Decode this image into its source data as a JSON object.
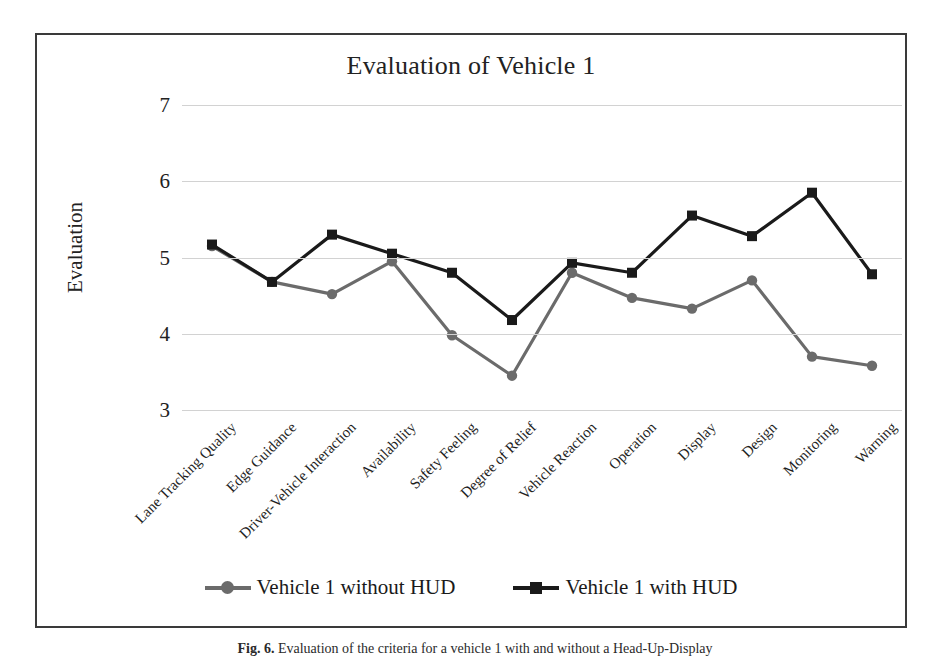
{
  "figure": {
    "caption_label": "Fig. 6.",
    "caption_text": "Evaluation of the criteria for a vehicle 1 with and without a Head-Up-Display"
  },
  "chart_data": {
    "type": "line",
    "title": "Evaluation of Vehicle 1",
    "xlabel": "",
    "ylabel": "Evaluation",
    "ylim": [
      3,
      7
    ],
    "yticks": [
      3,
      4,
      5,
      6,
      7
    ],
    "grid": true,
    "legend_position": "bottom",
    "categories": [
      "Lane Tracking Quality",
      "Edge Guidance",
      "Driver-Vehicle Interaction",
      "Availability",
      "Safety Feeling",
      "Degree of Relief",
      "Vehicle Reaction",
      "Operation",
      "Display",
      "Design",
      "Monitoring",
      "Warning"
    ],
    "series": [
      {
        "name": "Vehicle 1 without HUD",
        "color": "#6b6b6b",
        "marker": "circle",
        "values": [
          5.15,
          4.68,
          4.52,
          4.95,
          3.98,
          3.45,
          4.8,
          4.47,
          4.33,
          4.7,
          3.7,
          3.58
        ]
      },
      {
        "name": "Vehicle 1 with HUD",
        "color": "#1a1a1a",
        "marker": "square",
        "values": [
          5.17,
          4.68,
          5.3,
          5.05,
          4.8,
          4.18,
          4.93,
          4.8,
          5.55,
          5.28,
          5.85,
          4.78
        ]
      }
    ]
  },
  "colors": {
    "without_hud": "#6b6b6b",
    "with_hud": "#1a1a1a",
    "gridline": "#d2d2d2",
    "frame": "#3a3a3a",
    "text": "#1a1a1a"
  }
}
